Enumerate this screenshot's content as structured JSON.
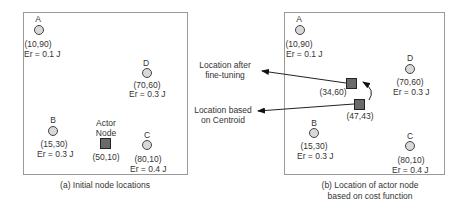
{
  "panel_a": {
    "caption": "(a) Initial node locations",
    "nodes": [
      {
        "label": "A",
        "coord": "(10,90)",
        "energy": "Er = 0.1 J"
      },
      {
        "label": "D",
        "coord": "(70,60)",
        "energy": "Er = 0.3 J"
      },
      {
        "label": "B",
        "coord": "(15,30)",
        "energy": "Er = 0.3 J"
      },
      {
        "label": "C",
        "coord": "(80,10)",
        "energy": "Er = 0.4 J"
      }
    ],
    "actor": {
      "label_line1": "Actor",
      "label_line2": "Node",
      "coord": "(50,10)"
    }
  },
  "panel_b": {
    "caption_line1": "(b) Location of actor node",
    "caption_line2": "based on cost function",
    "nodes": [
      {
        "label": "A",
        "coord": "(10,90)",
        "energy": "Er = 0.1 J"
      },
      {
        "label": "D",
        "coord": "(70,60)",
        "energy": "Er = 0.3 J"
      },
      {
        "label": "B",
        "coord": "(15,30)",
        "energy": "Er = 0.3 J"
      },
      {
        "label": "C",
        "coord": "(80,10)",
        "energy": "Er = 0.4 J"
      }
    ],
    "actor_fine": {
      "coord": "(34,60)"
    },
    "actor_centroid": {
      "coord": "(47,43)"
    }
  },
  "annotations": {
    "fine_tuning_line1": "Location after",
    "fine_tuning_line2": "fine-tuning",
    "centroid_line1": "Location based",
    "centroid_line2": "on Centroid"
  }
}
